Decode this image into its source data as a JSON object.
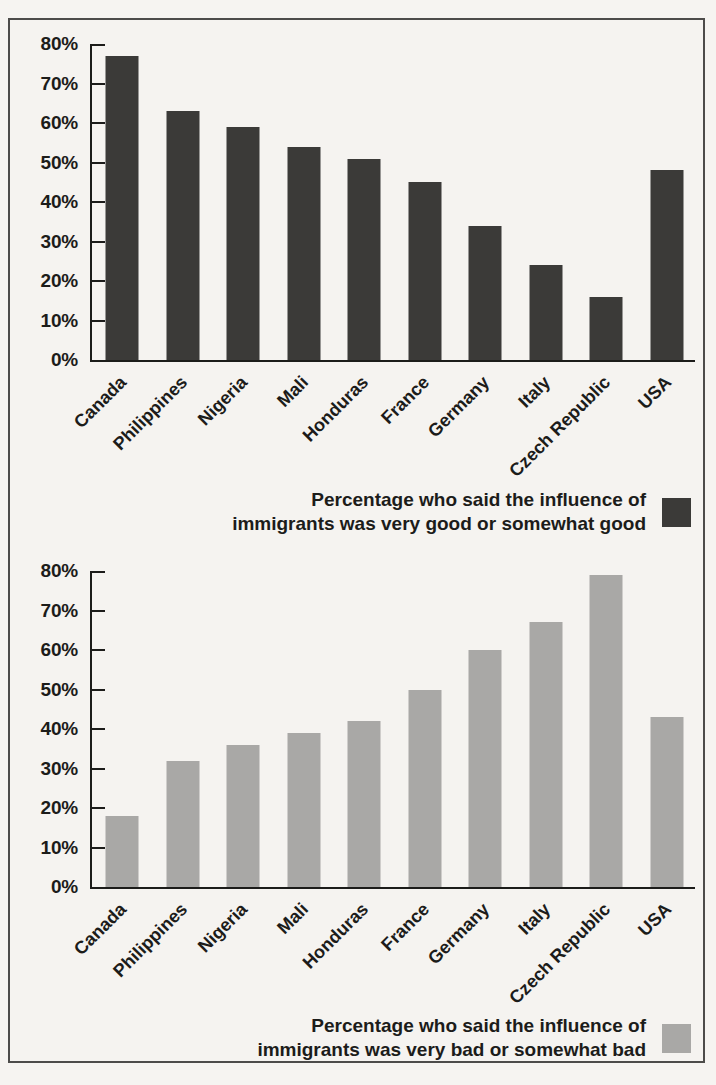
{
  "figure": {
    "background_color": "#f5f3f0",
    "frame_border_color": "#4d4c4a",
    "axis_color": "#1c1c1a"
  },
  "chart_data": [
    {
      "type": "bar",
      "title": "",
      "categories": [
        "Canada",
        "Philippines",
        "Nigeria",
        "Mali",
        "Honduras",
        "France",
        "Germany",
        "Italy",
        "Czech Republic",
        "USA"
      ],
      "values": [
        77,
        63,
        59,
        54,
        51,
        45,
        34,
        24,
        16,
        48
      ],
      "xlabel": "",
      "ylabel": "",
      "ylim": [
        0,
        80
      ],
      "ytick_step": 10,
      "ytick_labels": [
        "0%",
        "10%",
        "20%",
        "30%",
        "40%",
        "50%",
        "60%",
        "70%",
        "80%"
      ],
      "grid": false,
      "bar_color": "#3b3a38",
      "legend_lines": [
        "Percentage who said the influence of",
        "immigrants was very good or somewhat good"
      ],
      "legend_swatch_color": "#3b3a38",
      "legend_position": "below-right"
    },
    {
      "type": "bar",
      "title": "",
      "categories": [
        "Canada",
        "Philippines",
        "Nigeria",
        "Mali",
        "Honduras",
        "France",
        "Germany",
        "Italy",
        "Czech Republic",
        "USA"
      ],
      "values": [
        18,
        32,
        36,
        39,
        42,
        50,
        60,
        67,
        79,
        43
      ],
      "xlabel": "",
      "ylabel": "",
      "ylim": [
        0,
        80
      ],
      "ytick_step": 10,
      "ytick_labels": [
        "0%",
        "10%",
        "20%",
        "30%",
        "40%",
        "50%",
        "60%",
        "70%",
        "80%"
      ],
      "grid": false,
      "bar_color": "#a9a8a6",
      "legend_lines": [
        "Percentage who said the influence of",
        "immigrants was very bad or somewhat bad"
      ],
      "legend_swatch_color": "#a9a8a6",
      "legend_position": "below-right"
    }
  ]
}
